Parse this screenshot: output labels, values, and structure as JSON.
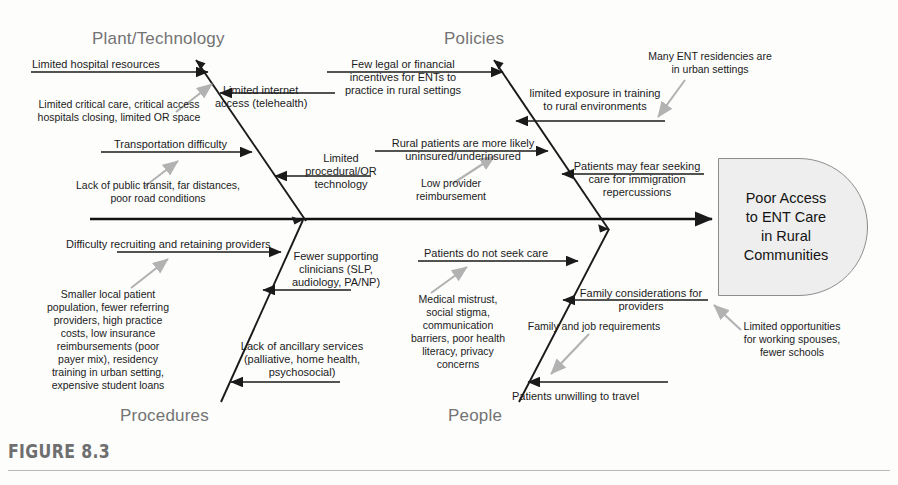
{
  "figure": {
    "number_label": "FIGURE 8.3",
    "type": "fishbone-cause-and-effect-diagram"
  },
  "effect": {
    "name": "effect-box",
    "lines": [
      "Poor Access",
      "to ENT Care",
      "in Rural",
      "Communities"
    ],
    "fill_color": "#eeeeee",
    "stroke_color": "#8d8d8d"
  },
  "categories": [
    {
      "id": "plant-technology",
      "label": "Plant/Technology",
      "position": "upper-left"
    },
    {
      "id": "policies",
      "label": "Policies",
      "position": "upper-right"
    },
    {
      "id": "procedures",
      "label": "Procedures",
      "position": "lower-left"
    },
    {
      "id": "people",
      "label": "People",
      "position": "lower-right"
    }
  ],
  "causes": {
    "plant_technology": [
      {
        "id": "limited-hospital-resources",
        "text": "Limited hospital resources",
        "arrow": "black-right"
      },
      {
        "id": "limited-internet-access",
        "text": "Limited internet\naccess (telehealth)",
        "arrow": "black-left"
      },
      {
        "id": "transportation-difficulty",
        "text": "Transportation difficulty",
        "arrow": "black-right"
      },
      {
        "id": "limited-procedural-or-technology",
        "text": "Limited\nprocedural/OR\ntechnology",
        "arrow": "black-left"
      }
    ],
    "plant_technology_sub": [
      {
        "id": "limited-critical-care-sub",
        "text": "Limited critical care, critical access\nhospitals closing, limited OR space",
        "arrow": "gray"
      },
      {
        "id": "lack-public-transit-sub",
        "text": "Lack of public transit, far distances,\npoor road conditions",
        "arrow": "gray"
      }
    ],
    "policies": [
      {
        "id": "few-legal-financial-incentives",
        "text": "Few legal or financial\nincentives for ENTs to\npractice in rural settings",
        "arrow": "black-right"
      },
      {
        "id": "limited-exposure-training",
        "text": "limited exposure in training\nto rural environments",
        "arrow": "black-left"
      },
      {
        "id": "rural-patients-uninsured",
        "text": "Rural patients are more likely\nuninsured/underinsured",
        "arrow": "black-right"
      },
      {
        "id": "patients-fear-immigration",
        "text": "Patients may fear seeking\ncare for immigration\nrepercussions",
        "arrow": "black-left"
      }
    ],
    "policies_sub": [
      {
        "id": "many-ent-residencies-sub",
        "text": "Many ENT residencies are\nin urban settings",
        "arrow": "gray"
      },
      {
        "id": "low-provider-reimbursement-sub",
        "text": "Low provider\nreimbursement",
        "arrow": "gray"
      }
    ],
    "procedures": [
      {
        "id": "difficulty-recruiting-retaining",
        "text": "Difficulty recruiting and retaining providers",
        "arrow": "black-right"
      },
      {
        "id": "fewer-supporting-clinicians",
        "text": "Fewer supporting\nclinicians (SLP,\naudiology, PA/NP)",
        "arrow": "black-left"
      },
      {
        "id": "lack-ancillary-services",
        "text": "Lack of ancillary services\n(palliative, home health,\npsychosocial)",
        "arrow": "black-left"
      }
    ],
    "procedures_sub": [
      {
        "id": "smaller-local-patient-population-sub",
        "text": "Smaller local patient\npopulation, fewer referring\nproviders, high practice\ncosts, low insurance\nreimbursements (poor\npayer mix), residency\ntraining in urban setting,\nexpensive student loans",
        "arrow": "gray"
      }
    ],
    "people": [
      {
        "id": "patients-do-not-seek-care",
        "text": "Patients do not seek care",
        "arrow": "black-right"
      },
      {
        "id": "family-considerations-providers",
        "text": "Family considerations for\nproviders",
        "arrow": "black-left"
      },
      {
        "id": "patients-unwilling-to-travel",
        "text": "Patients unwilling to travel",
        "arrow": "black-left"
      }
    ],
    "people_sub": [
      {
        "id": "medical-mistrust-sub",
        "text": "Medical mistrust,\nsocial stigma,\ncommunication\nbarriers, poor health\nliteracy, privacy\nconcerns",
        "arrow": "gray"
      },
      {
        "id": "family-job-requirements-sub",
        "text": "Family and job requirements",
        "arrow": "gray"
      },
      {
        "id": "limited-opportunities-spouses-sub",
        "text": "Limited opportunities\nfor working spouses,\nfewer schools",
        "arrow": "gray"
      }
    ]
  },
  "text": {
    "cat_plant": "Plant/Technology",
    "cat_policies": "Policies",
    "cat_procedures": "Procedures",
    "cat_people": "People",
    "effect_l1": "Poor Access",
    "effect_l2": "to ENT Care",
    "effect_l3": "in Rural",
    "effect_l4": "Communities",
    "fig": "FIGURE 8.3",
    "pt_1": "Limited hospital resources",
    "pt_2a": "Limited internet",
    "pt_2b": "access (telehealth)",
    "pt_3": "Transportation difficulty",
    "pt_4a": "Limited",
    "pt_4b": "procedural/OR",
    "pt_4c": "technology",
    "pt_s1a": "Limited critical care, critical access",
    "pt_s1b": "hospitals closing, limited OR space",
    "pt_s2a": "Lack of public transit, far distances,",
    "pt_s2b": "poor road conditions",
    "po_1a": "Few legal or financial",
    "po_1b": "incentives for ENTs to",
    "po_1c": "practice in rural settings",
    "po_2a": "limited exposure in training",
    "po_2b": "to rural environments",
    "po_3a": "Rural patients are more likely",
    "po_3b": "uninsured/underinsured",
    "po_4a": "Patients may fear seeking",
    "po_4b": "care for immigration",
    "po_4c": "repercussions",
    "po_s1a": "Many ENT residencies are",
    "po_s1b": "in urban settings",
    "po_s2a": "Low provider",
    "po_s2b": "reimbursement",
    "pr_1": "Difficulty recruiting and retaining providers",
    "pr_2a": "Fewer supporting",
    "pr_2b": "clinicians (SLP,",
    "pr_2c": "audiology, PA/NP)",
    "pr_3a": "Lack of ancillary services",
    "pr_3b": "(palliative, home health,",
    "pr_3c": "psychosocial)",
    "pr_s1a": "Smaller local patient",
    "pr_s1b": "population, fewer referring",
    "pr_s1c": "providers, high practice",
    "pr_s1d": "costs, low insurance",
    "pr_s1e": "reimbursements (poor",
    "pr_s1f": "payer mix), residency",
    "pr_s1g": "training in urban setting,",
    "pr_s1h": "expensive student loans",
    "pe_1": "Patients do not seek care",
    "pe_2a": "Family considerations for",
    "pe_2b": "providers",
    "pe_3": "Patients unwilling to travel",
    "pe_s1a": "Medical mistrust,",
    "pe_s1b": "social stigma,",
    "pe_s1c": "communication",
    "pe_s1d": "barriers, poor health",
    "pe_s1e": "literacy, privacy",
    "pe_s1f": "concerns",
    "pe_s2": "Family and job requirements",
    "pe_s3a": "Limited opportunities",
    "pe_s3b": "for working spouses,",
    "pe_s3c": "fewer schools"
  },
  "colors": {
    "spine": "#111111",
    "bone": "#1a1a1a",
    "sub_arrow": "#b2b2b2",
    "category_text": "#737373",
    "figure_label": "#6f6f6f"
  }
}
